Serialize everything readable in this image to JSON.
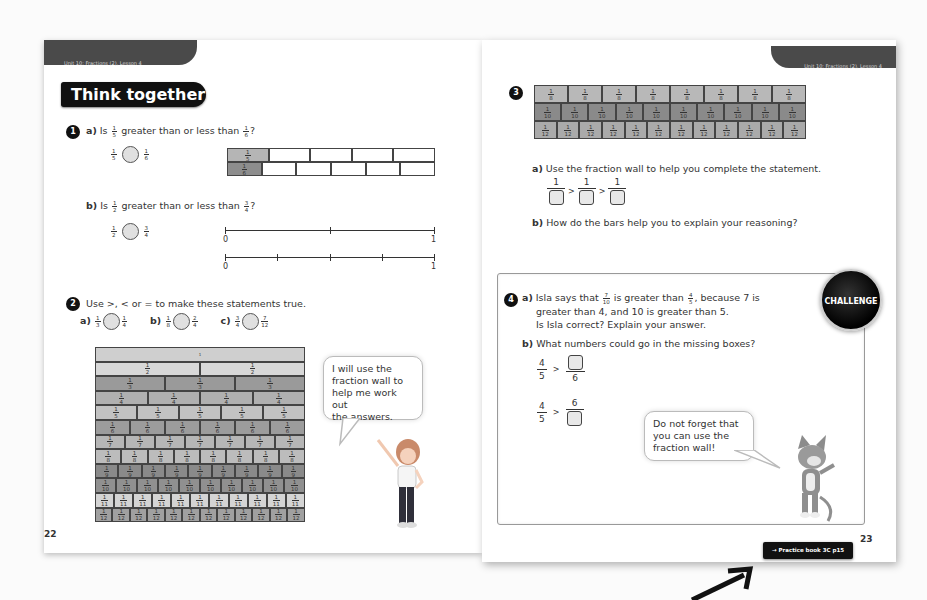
{
  "left_page": {
    "unit_header": "Unit 10: Fractions (2), Lesson 4",
    "section_title": "Think together",
    "page_number": "22",
    "q1": {
      "number": "1",
      "a": {
        "label": "a)",
        "text_prefix": "Is",
        "frac1": {
          "n": "1",
          "d": "5"
        },
        "text_mid": "greater than or less than",
        "frac2": {
          "n": "1",
          "d": "6"
        },
        "text_suffix": "?",
        "bars": [
          {
            "shaded_label": "1/5",
            "parts": 5,
            "color": "#b5b5b5"
          },
          {
            "shaded_label": "1/6",
            "parts": 6,
            "color": "#8d8d8d"
          }
        ]
      },
      "b": {
        "label": "b)",
        "text_prefix": "Is",
        "frac1": {
          "n": "1",
          "d": "2"
        },
        "text_mid": "greater than or less than",
        "frac2": {
          "n": "3",
          "d": "4"
        },
        "text_suffix": "?",
        "number_lines": [
          {
            "start": "0",
            "end": "1",
            "divisions": 2
          },
          {
            "start": "0",
            "end": "1",
            "divisions": 4
          }
        ]
      }
    },
    "q2": {
      "number": "2",
      "instruction": "Use >, < or = to make these statements true.",
      "items": [
        {
          "label": "a)",
          "f1": {
            "n": "1",
            "d": "3"
          },
          "f2": {
            "n": "1",
            "d": "4"
          }
        },
        {
          "label": "b)",
          "f1": {
            "n": "1",
            "d": "8"
          },
          "f2": {
            "n": "2",
            "d": "4"
          }
        },
        {
          "label": "c)",
          "f1": {
            "n": "3",
            "d": "4"
          },
          "f2": {
            "n": "7",
            "d": "12"
          }
        }
      ],
      "fraction_wall_rows": [
        1,
        2,
        3,
        4,
        5,
        6,
        7,
        8,
        9,
        10,
        11,
        12
      ],
      "speech_bubble": "I will use the\nfraction wall to\nhelp me work out\nthe answers."
    }
  },
  "right_page": {
    "unit_header": "Unit 10: Fractions (2), Lesson 4",
    "page_number": "23",
    "q3": {
      "number": "3",
      "bars": [
        {
          "denominator": 8,
          "color": "#b8b8b8"
        },
        {
          "denominator": 10,
          "color": "#8a8a8a"
        },
        {
          "denominator": 12,
          "color": "#aaaaaa"
        }
      ],
      "a": {
        "label": "a)",
        "text": "Use the fraction wall to help you complete the statement.",
        "numerator": "1",
        "symbol": ">"
      },
      "b": {
        "label": "b)",
        "text": "How do the bars help you to explain your reasoning?"
      }
    },
    "q4": {
      "number": "4",
      "badge": "CHALLENGE",
      "a": {
        "label": "a)",
        "line1_prefix": "Isla says that",
        "frac1": {
          "n": "7",
          "d": "10"
        },
        "line1_mid": "is greater than",
        "frac2": {
          "n": "4",
          "d": "5"
        },
        "line1_suffix": ", because 7 is",
        "line2": "greater than 4, and 10 is greater than 5.",
        "line3": "Is Isla correct? Explain your answer."
      },
      "b": {
        "label": "b)",
        "text": "What numbers could go in the missing boxes?",
        "statement1": {
          "left_n": "4",
          "left_d": "5",
          "symbol": ">",
          "right_d": "6"
        },
        "statement2": {
          "left_n": "4",
          "left_d": "5",
          "symbol": ">",
          "right_n": "6"
        }
      },
      "speech_bubble": "Do not forget that\nyou can use the\nfraction wall!"
    },
    "practice_link": "→ Practice book 3C p15"
  }
}
